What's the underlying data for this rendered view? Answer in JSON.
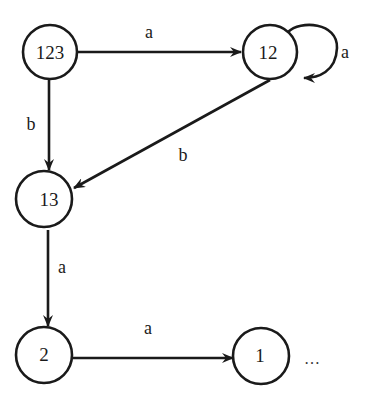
{
  "diagram": {
    "type": "state-transition-graph",
    "nodes": [
      {
        "id": "123",
        "label": "123"
      },
      {
        "id": "12",
        "label": "12"
      },
      {
        "id": "13",
        "label": "13"
      },
      {
        "id": "2",
        "label": "2"
      },
      {
        "id": "1",
        "label": "1"
      }
    ],
    "edges": [
      {
        "from": "123",
        "to": "12",
        "label": "a"
      },
      {
        "from": "12",
        "to": "12",
        "label": "a"
      },
      {
        "from": "123",
        "to": "13",
        "label": "b"
      },
      {
        "from": "12",
        "to": "13",
        "label": "b"
      },
      {
        "from": "13",
        "to": "2",
        "label": "a"
      },
      {
        "from": "2",
        "to": "1",
        "label": "a"
      }
    ],
    "continuation": "…",
    "colors": {
      "stroke": "#1a1a1a",
      "background": "#ffffff"
    }
  }
}
